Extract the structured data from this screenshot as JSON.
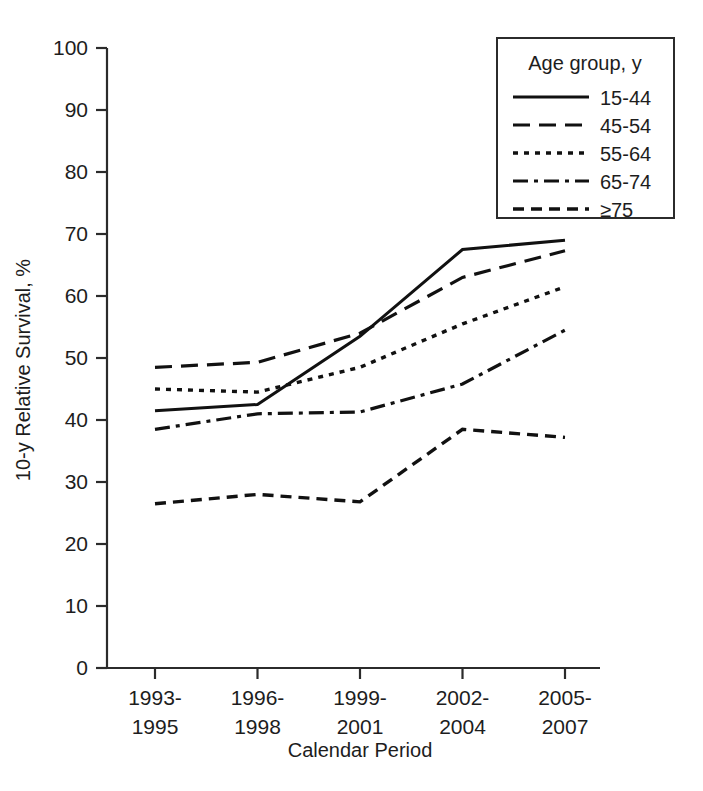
{
  "chart_data": {
    "type": "line",
    "title": "",
    "xlabel": "Calendar Period",
    "ylabel": "10-y Relative Survival, %",
    "categories": [
      "1993-1995",
      "1996-1998",
      "1999-2001",
      "2002-2004",
      "2005-2007"
    ],
    "category_lines": [
      [
        "1993-",
        "1995"
      ],
      [
        "1996-",
        "1998"
      ],
      [
        "1999-",
        "2001"
      ],
      [
        "2002-",
        "2004"
      ],
      [
        "2005-",
        "2007"
      ]
    ],
    "ylim": [
      0,
      100
    ],
    "yticks": [
      0,
      10,
      20,
      30,
      40,
      50,
      60,
      70,
      80,
      90,
      100
    ],
    "ytick_labels": [
      "0",
      "10",
      "20",
      "30",
      "40",
      "50",
      "60",
      "70",
      "80",
      "90",
      "100"
    ],
    "grid": false,
    "legend_position": "top-right",
    "legend_title": "Age group, y",
    "series": [
      {
        "name": "15-44",
        "dash": "solid",
        "values": [
          41.5,
          42.5,
          53.5,
          67.5,
          69.0
        ]
      },
      {
        "name": "45-54",
        "dash": "longdash",
        "values": [
          48.5,
          49.3,
          54.0,
          63.0,
          67.3
        ]
      },
      {
        "name": "55-64",
        "dash": "dotted",
        "values": [
          45.0,
          44.5,
          48.5,
          55.5,
          61.5
        ]
      },
      {
        "name": "65-74",
        "dash": "dashdot",
        "values": [
          38.5,
          41.0,
          41.3,
          45.8,
          54.5
        ]
      },
      {
        "name": "≥75",
        "dash": "dash",
        "values": [
          26.5,
          28.0,
          26.8,
          38.5,
          37.2
        ]
      }
    ],
    "colors": {
      "line": "#111111",
      "axis": "#2b2b2b",
      "text": "#1d1d1d",
      "background": "#ffffff"
    }
  },
  "legend": {
    "title": "Age group, y",
    "entries": [
      {
        "label": "15-44"
      },
      {
        "label": "45-54"
      },
      {
        "label": "55-64"
      },
      {
        "label": "65-74"
      },
      {
        "label": "≥75"
      }
    ]
  },
  "axes": {
    "y_title": "10-y Relative Survival, %",
    "x_title": "Calendar Period"
  }
}
